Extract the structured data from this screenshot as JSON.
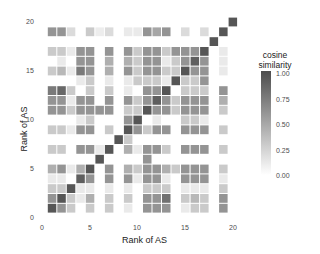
{
  "chart_data": {
    "type": "heatmap",
    "title": "",
    "xlabel": "Rank of AS",
    "ylabel": "Rank of AS",
    "xlim": [
      0,
      21
    ],
    "ylim": [
      0,
      21
    ],
    "x_ticks": [
      "0",
      "5",
      "10",
      "15",
      "20"
    ],
    "y_ticks": [
      "0",
      "5",
      "10",
      "15",
      "20"
    ],
    "legend": {
      "title_line1": "cosine",
      "title_line2": "similarity",
      "labels": [
        "1.00",
        "0.75",
        "0.50",
        "0.25",
        "0.00"
      ],
      "low_color": "#ffffff",
      "high_color": "#4d4d4d"
    },
    "grid": false,
    "cells_note": "rows indexed y=1..20, each array gives values for x=1..20; 0 means no cell",
    "rows": {
      "1": [
        0.95,
        0.6,
        0.3,
        0,
        0.3,
        0,
        0.3,
        0,
        0.12,
        0,
        0.6,
        0.6,
        0.6,
        0,
        0.12,
        0.3,
        0.3,
        0,
        0.6,
        0
      ],
      "2": [
        0.6,
        0.95,
        0.3,
        0.12,
        0.45,
        0,
        0.3,
        0,
        0.3,
        0,
        0.6,
        0.6,
        0.8,
        0,
        0.3,
        0.4,
        0.3,
        0,
        0.6,
        0
      ],
      "3": [
        0.3,
        0.3,
        0.95,
        0.12,
        0.12,
        0,
        0.12,
        0,
        0.12,
        0,
        0.3,
        0.3,
        0.3,
        0,
        0.12,
        0.12,
        0.12,
        0,
        0.3,
        0
      ],
      "4": [
        0.12,
        0.12,
        0,
        0.9,
        0.6,
        0,
        0.6,
        0,
        0.6,
        0.12,
        0.6,
        0.6,
        0.12,
        0,
        0.6,
        0.6,
        0.6,
        0,
        0.12,
        0
      ],
      "5": [
        0.45,
        0.6,
        0.12,
        0.45,
        0.95,
        0,
        0.6,
        0,
        0.45,
        0.3,
        0.6,
        0.6,
        0.45,
        0.3,
        0.6,
        0.6,
        0.6,
        0,
        0.3,
        0
      ],
      "6": [
        0,
        0,
        0,
        0,
        0,
        0.95,
        0,
        0,
        0,
        0,
        0.6,
        0,
        0,
        0,
        0,
        0,
        0,
        0,
        0,
        0
      ],
      "7": [
        0.3,
        0.3,
        0,
        0.6,
        0.6,
        0.12,
        0.95,
        0,
        0.45,
        0.12,
        0.6,
        0.6,
        0.3,
        0,
        0.6,
        0.6,
        0.6,
        0,
        0.3,
        0
      ],
      "8": [
        0,
        0,
        0,
        0,
        0,
        0,
        0,
        0.95,
        0.3,
        0,
        0,
        0,
        0,
        0,
        0,
        0,
        0,
        0,
        0,
        0
      ],
      "9": [
        0.3,
        0.3,
        0.12,
        0.6,
        0.6,
        0,
        0.3,
        0,
        0.95,
        0.6,
        0.3,
        0.6,
        0.6,
        0,
        0.6,
        0.6,
        0.6,
        0,
        0.3,
        0
      ],
      "10": [
        0,
        0,
        0,
        0.12,
        0.3,
        0,
        0,
        0,
        0.6,
        0.95,
        0,
        0.12,
        0,
        0,
        0.3,
        0.3,
        0.12,
        0,
        0,
        0
      ],
      "11": [
        0.6,
        0.6,
        0.3,
        0.6,
        0.6,
        0.6,
        0.6,
        0,
        0.3,
        0.3,
        0.95,
        0.6,
        0.6,
        0.3,
        0.6,
        0.6,
        0.6,
        0,
        0.3,
        0
      ],
      "12": [
        0.6,
        0.6,
        0.12,
        0.6,
        0.6,
        0,
        0.6,
        0,
        0.6,
        0.3,
        0.6,
        0.9,
        0.6,
        0.3,
        0.6,
        0.6,
        0.6,
        0,
        0.45,
        0
      ],
      "13": [
        0.75,
        0.85,
        0.3,
        0,
        0.3,
        0,
        0.3,
        0,
        0.12,
        0,
        0.6,
        0.6,
        0.95,
        0,
        0.3,
        0.3,
        0.3,
        0,
        0.6,
        0
      ],
      "14": [
        0,
        0,
        0,
        0.12,
        0.3,
        0,
        0.12,
        0,
        0.12,
        0.3,
        0.3,
        0.3,
        0.12,
        0.95,
        0.3,
        0.3,
        0.6,
        0,
        0,
        0
      ],
      "15": [
        0.3,
        0.4,
        0.12,
        0.75,
        0.6,
        0,
        0.45,
        0,
        0.6,
        0.3,
        0.6,
        0.6,
        0.3,
        0.3,
        0.95,
        0.6,
        0.6,
        0,
        0.12,
        0
      ],
      "16": [
        0,
        0.12,
        0,
        0.6,
        0.6,
        0,
        0.45,
        0,
        0.45,
        0.3,
        0.6,
        0.6,
        0.12,
        0.3,
        0.6,
        0.9,
        0.6,
        0,
        0.12,
        0
      ],
      "17": [
        0.3,
        0.3,
        0.12,
        0.6,
        0.6,
        0,
        0.6,
        0,
        0.6,
        0.3,
        0.6,
        0.6,
        0.3,
        0.6,
        0.6,
        0.6,
        0.95,
        0,
        0.12,
        0
      ],
      "18": [
        0,
        0,
        0,
        0,
        0,
        0,
        0,
        0,
        0,
        0,
        0,
        0,
        0,
        0,
        0,
        0,
        0,
        0.95,
        0,
        0
      ],
      "19": [
        0.6,
        0.6,
        0.2,
        0,
        0.3,
        0.1,
        0.2,
        0,
        0.12,
        0.12,
        0.6,
        0.5,
        0.6,
        0,
        0.2,
        0,
        0.2,
        0,
        0.95,
        0
      ],
      "20": [
        0,
        0,
        0,
        0,
        0,
        0,
        0,
        0,
        0,
        0,
        0,
        0,
        0,
        0,
        0,
        0,
        0,
        0,
        0,
        0.95
      ]
    }
  }
}
